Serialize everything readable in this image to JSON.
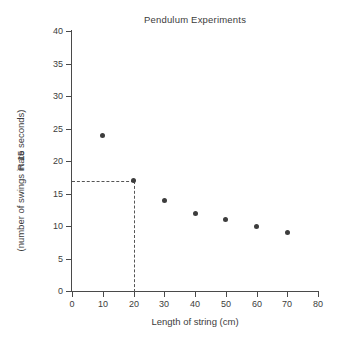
{
  "chart_data": {
    "type": "scatter",
    "title": "Pendulum Experiments",
    "xlabel": "Length of string (cm)",
    "ylabel_line1": "Rate",
    "ylabel_line2": "(number of swings in 15 seconds)",
    "xlim": [
      0,
      80
    ],
    "ylim": [
      0,
      40
    ],
    "xticks": [
      0,
      10,
      20,
      30,
      40,
      50,
      60,
      70,
      80
    ],
    "yticks": [
      0,
      5,
      10,
      15,
      20,
      25,
      30,
      35,
      40
    ],
    "xtick_labels": [
      "0",
      "10",
      "20",
      "30",
      "40",
      "50",
      "60",
      "70",
      "80"
    ],
    "ytick_labels": [
      "0",
      "5",
      "10",
      "15",
      "20",
      "25",
      "30",
      "35",
      "40"
    ],
    "grid": false,
    "legend": null,
    "marker_color": "#3d3d3d",
    "axis_color": "#4a4a4a",
    "background": "#ffffff",
    "x": [
      10,
      20,
      30,
      40,
      50,
      60,
      70
    ],
    "values": [
      24,
      17,
      14,
      12,
      11,
      10,
      9
    ],
    "points": [
      {
        "x": 10,
        "y": 24
      },
      {
        "x": 20,
        "y": 17
      },
      {
        "x": 30,
        "y": 14
      },
      {
        "x": 40,
        "y": 12
      },
      {
        "x": 50,
        "y": 11
      },
      {
        "x": 60,
        "y": 10
      },
      {
        "x": 70,
        "y": 9
      }
    ],
    "annotations": [
      {
        "type": "guide-lines",
        "style": "dashed",
        "color": "#555555",
        "from_axis_y": 17,
        "to_point": {
          "x": 20,
          "y": 17
        },
        "down_to_axis_x": 20
      }
    ]
  }
}
